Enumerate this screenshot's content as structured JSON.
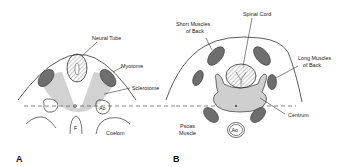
{
  "figure": {
    "panel_a": {
      "letter": "A",
      "labels": {
        "neural_tube": "Neural Tube",
        "myotome": "Myotome",
        "sclerotome": "Sclerotome",
        "aorta": "Ao",
        "f": "F",
        "coelom": "Coelom"
      }
    },
    "panel_b": {
      "letter": "B",
      "labels": {
        "spinal_cord": "Spinal Cord",
        "short_muscles_1": "Short Muscles",
        "short_muscles_2": "of Back",
        "long_muscles_1": "Long Muscles",
        "long_muscles_2": "of Back",
        "centrum": "Centrum",
        "psoas_1": "Psoas",
        "psoas_2": "Muscle",
        "aorta": "Ao"
      }
    },
    "colors": {
      "muscle": "#6e6e6e",
      "sclerotome": "#d2d2d2",
      "outline": "#333333"
    }
  }
}
